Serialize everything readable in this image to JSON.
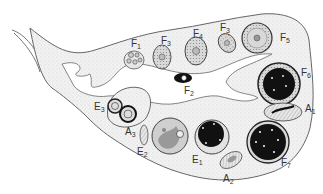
{
  "diagram": {
    "colors": {
      "stroma": "#eeeeee",
      "outline": "#666666",
      "dark_antrum": "#111111",
      "follicle_fill": "#dcdcdc"
    },
    "labels": [
      {
        "id": "F1",
        "letter": "F",
        "sub": "1",
        "x": 131,
        "y": 39
      },
      {
        "id": "F3a",
        "letter": "F",
        "sub": "3",
        "x": 161,
        "y": 36
      },
      {
        "id": "F4",
        "letter": "F",
        "sub": "4",
        "x": 193,
        "y": 29
      },
      {
        "id": "F3b",
        "letter": "F",
        "sub": "3",
        "x": 220,
        "y": 23
      },
      {
        "id": "F5",
        "letter": "F",
        "sub": "5",
        "x": 280,
        "y": 33
      },
      {
        "id": "F2",
        "letter": "F",
        "sub": "2",
        "x": 184,
        "y": 86
      },
      {
        "id": "F6",
        "letter": "F",
        "sub": "6",
        "x": 301,
        "y": 68
      },
      {
        "id": "A1",
        "letter": "A",
        "sub": "1",
        "x": 305,
        "y": 104
      },
      {
        "id": "E3",
        "letter": "E",
        "sub": "3",
        "x": 94,
        "y": 102
      },
      {
        "id": "A3",
        "letter": "A",
        "sub": "3",
        "x": 125,
        "y": 127
      },
      {
        "id": "E2",
        "letter": "E",
        "sub": "2",
        "x": 137,
        "y": 147
      },
      {
        "id": "E1",
        "letter": "E",
        "sub": "1",
        "x": 192,
        "y": 155
      },
      {
        "id": "A2",
        "letter": "A",
        "sub": "2",
        "x": 223,
        "y": 174
      },
      {
        "id": "F7",
        "letter": "F",
        "sub": "7",
        "x": 281,
        "y": 158
      }
    ]
  }
}
